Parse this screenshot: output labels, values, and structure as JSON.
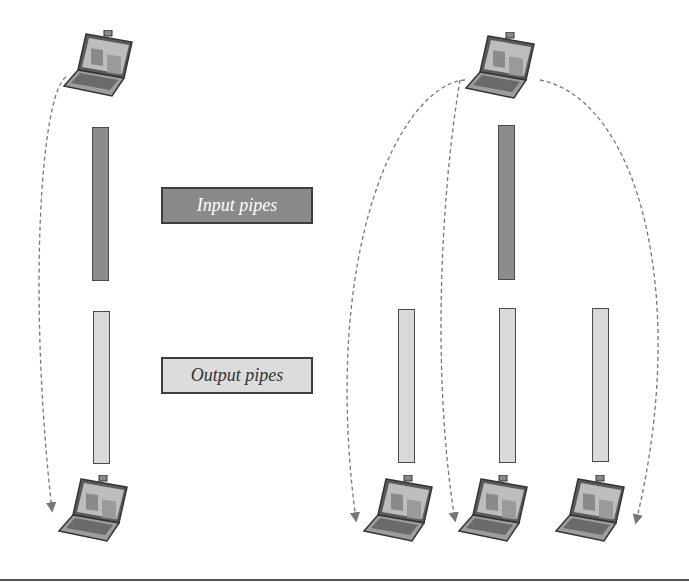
{
  "diagram": {
    "labels": {
      "input_pipes": "Input pipes",
      "output_pipes": "Output pipes"
    },
    "colors": {
      "input_pipe_fill": "#8c8c8c",
      "output_pipe_fill": "#d9d9d9",
      "outline": "#4a4a4a",
      "arrow": "#777777"
    },
    "left_group": {
      "source": "laptop",
      "pipes": [
        "input pipe",
        "output pipe"
      ],
      "destinations": [
        "laptop"
      ]
    },
    "right_group": {
      "source": "laptop",
      "pipes": [
        "input pipe",
        "output pipe",
        "output pipe",
        "output pipe"
      ],
      "destinations": [
        "laptop",
        "laptop",
        "laptop"
      ]
    }
  }
}
